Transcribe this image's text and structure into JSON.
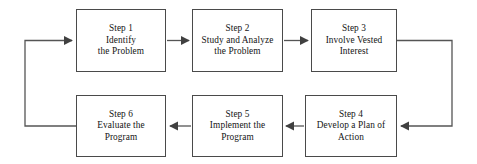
{
  "diagram": {
    "type": "flowchart",
    "orientation": "cyclical-snake",
    "background_color": "#ffffff",
    "box_border_color": "#4a4a4a",
    "connector_color": "#555555",
    "text_color": "#141414",
    "steps": [
      {
        "id": "step-1",
        "title": "Step 1",
        "line2": "Identify",
        "line3": "the Problem"
      },
      {
        "id": "step-2",
        "title": "Step 2",
        "line2": "Study and Analyze",
        "line3": "the Problem"
      },
      {
        "id": "step-3",
        "title": "Step 3",
        "line2": "Involve Vested",
        "line3": "Interest"
      },
      {
        "id": "step-4",
        "title": "Step 4",
        "line2": "Develop a Plan of",
        "line3": "Action"
      },
      {
        "id": "step-5",
        "title": "Step 5",
        "line2": "Implement the",
        "line3": "Program"
      },
      {
        "id": "step-6",
        "title": "Step 6",
        "line2": "Evaluate the",
        "line3": "Program"
      }
    ],
    "connectors": [
      {
        "id": "connector-1-to-2",
        "from": "step-1",
        "to": "step-2",
        "direction": "right"
      },
      {
        "id": "connector-2-to-3",
        "from": "step-2",
        "to": "step-3",
        "direction": "right"
      },
      {
        "id": "connector-3-to-4",
        "from": "step-3",
        "to": "step-4",
        "direction": "right-down-left"
      },
      {
        "id": "connector-4-to-5",
        "from": "step-4",
        "to": "step-5",
        "direction": "left"
      },
      {
        "id": "connector-5-to-6",
        "from": "step-5",
        "to": "step-6",
        "direction": "left"
      },
      {
        "id": "connector-6-to-1",
        "from": "step-6",
        "to": "step-1",
        "direction": "left-up-right"
      }
    ]
  }
}
